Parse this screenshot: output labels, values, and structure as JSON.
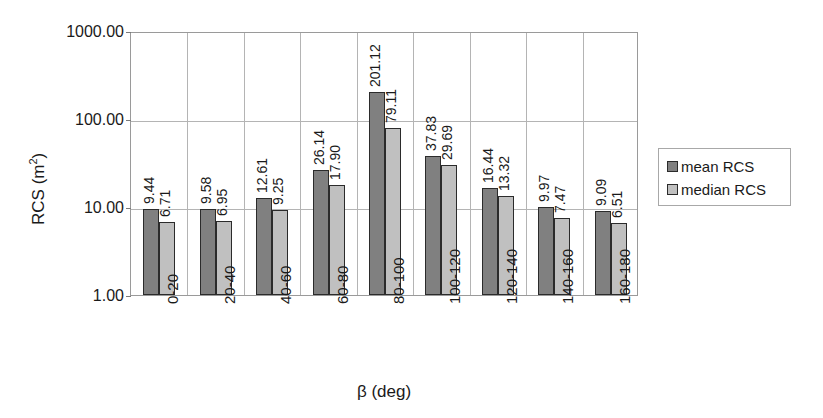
{
  "chart_data": {
    "type": "bar",
    "title": "",
    "subtitle": "",
    "xlabel": "β (deg)",
    "ylabel": "RCS (m²)",
    "yscale": "log",
    "ylim": [
      1,
      1000
    ],
    "ytick_labels": [
      "1000.00",
      "100.00",
      "10.00",
      "1.00"
    ],
    "ytick_values": [
      1000,
      100,
      10,
      1
    ],
    "grid": "horizontal-and-vertical",
    "legend_position": "right",
    "categories": [
      "0-20",
      "20-40",
      "40-60",
      "60-80",
      "80-100",
      "100-120",
      "120-140",
      "140-160",
      "160-180"
    ],
    "series": [
      {
        "name": "mean RCS",
        "color": "#808080",
        "values": [
          9.44,
          9.58,
          12.61,
          26.14,
          201.12,
          37.83,
          16.44,
          9.97,
          9.09
        ],
        "labels": [
          "9.44",
          "9.58",
          "12.61",
          "26.14",
          "201.12",
          "37.83",
          "16.44",
          "9.97",
          "9.09"
        ]
      },
      {
        "name": "median RCS",
        "color": "#c0c0c0",
        "values": [
          6.71,
          6.95,
          9.25,
          17.9,
          79.11,
          29.69,
          13.32,
          7.47,
          6.51
        ],
        "labels": [
          "6.71",
          "6.95",
          "9.25",
          "17.90",
          "79.11",
          "29.69",
          "13.32",
          "7.47",
          "6.51"
        ]
      }
    ]
  },
  "axes": {
    "y_title": "RCS (m",
    "y_title_sup": "2",
    "y_title_tail": ")",
    "x_title": "β (deg)"
  },
  "legend": {
    "items": [
      {
        "label": "mean RCS",
        "color": "#808080"
      },
      {
        "label": "median RCS",
        "color": "#c0c0c0"
      }
    ]
  },
  "colors": {
    "mean": "#808080",
    "median": "#c0c0c0",
    "bar_border": "#2b2b2b",
    "grid": "#b4b4b4",
    "frame": "#9a9a9a",
    "text": "#1a1a1a",
    "background": "#ffffff"
  }
}
